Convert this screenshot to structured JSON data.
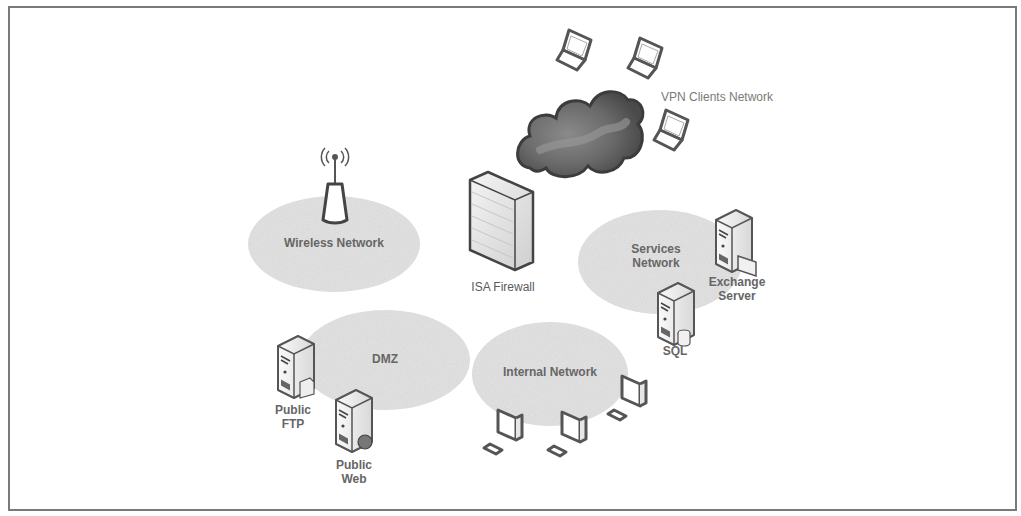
{
  "diagram": {
    "colors": {
      "frame_border": "#7a7a7a",
      "zone_fill": "#e2e2e2",
      "cloud_fill": "#5c5c5c",
      "icon_stroke": "#555555",
      "label_text": "#5a5a5a"
    },
    "zones": [
      {
        "id": "wireless",
        "label": "Wireless Network"
      },
      {
        "id": "services",
        "label": "Services\nNetwork"
      },
      {
        "id": "dmz",
        "label": "DMZ"
      },
      {
        "id": "internal",
        "label": "Internal Network"
      },
      {
        "id": "vpn",
        "label": "VPN Clients Network"
      }
    ],
    "nodes": [
      {
        "id": "firewall",
        "label": "ISA Firewall",
        "icon": "firewall-icon"
      },
      {
        "id": "exchange",
        "label": "Exchange\nServer",
        "icon": "server-icon"
      },
      {
        "id": "sql",
        "label": "SQL",
        "icon": "database-server-icon"
      },
      {
        "id": "ftp",
        "label": "Public\nFTP",
        "icon": "server-icon"
      },
      {
        "id": "web",
        "label": "Public\nWeb",
        "icon": "web-server-icon"
      },
      {
        "id": "access_point",
        "label": "",
        "icon": "wireless-access-point-icon"
      },
      {
        "id": "internet",
        "label": "",
        "icon": "cloud-icon"
      }
    ],
    "vpn_clients_count": 3,
    "internal_workstations_count": 3
  }
}
